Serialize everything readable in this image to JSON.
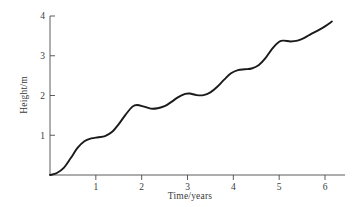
{
  "chart_data": {
    "type": "line",
    "title": "",
    "subtitle": "",
    "xlabel": "Time/years",
    "ylabel": "Height/m",
    "xlim": [
      0,
      6.4
    ],
    "ylim": [
      0,
      4.1
    ],
    "xticks": [
      1,
      2,
      3,
      4,
      5,
      6
    ],
    "xtick_labels": [
      "1",
      "2",
      "3",
      "4",
      "5",
      "6"
    ],
    "yticks": [
      1,
      2,
      3,
      4
    ],
    "ytick_labels": [
      "1",
      "2",
      "3",
      "4"
    ],
    "grid": false,
    "legend": null,
    "legend_position": "none",
    "annotations": [],
    "series": [
      {
        "name": "Height",
        "color": "#1a1a1a",
        "x": [
          0.0,
          0.15,
          0.3,
          0.45,
          0.6,
          0.75,
          0.9,
          1.05,
          1.2,
          1.35,
          1.5,
          1.65,
          1.8,
          1.9,
          2.05,
          2.2,
          2.35,
          2.5,
          2.65,
          2.8,
          2.95,
          3.05,
          3.2,
          3.35,
          3.5,
          3.65,
          3.8,
          3.95,
          4.1,
          4.25,
          4.4,
          4.55,
          4.7,
          4.85,
          5.0,
          5.1,
          5.25,
          5.4,
          5.55,
          5.7,
          5.85,
          6.0,
          6.15
        ],
        "y": [
          0.0,
          0.05,
          0.18,
          0.42,
          0.68,
          0.85,
          0.92,
          0.95,
          0.98,
          1.08,
          1.28,
          1.52,
          1.72,
          1.76,
          1.72,
          1.67,
          1.68,
          1.73,
          1.84,
          1.96,
          2.04,
          2.05,
          2.01,
          2.01,
          2.08,
          2.22,
          2.4,
          2.56,
          2.64,
          2.66,
          2.68,
          2.76,
          2.94,
          3.18,
          3.35,
          3.38,
          3.36,
          3.38,
          3.45,
          3.55,
          3.64,
          3.74,
          3.86
        ]
      }
    ]
  },
  "axes": {
    "y_axis_name": "height-axis",
    "x_axis_name": "time-axis"
  }
}
